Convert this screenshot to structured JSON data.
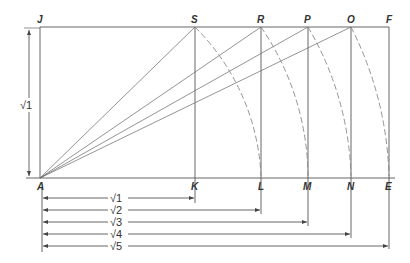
{
  "diagram": {
    "points": {
      "J": {
        "label": "J",
        "x": 40,
        "y": 27
      },
      "S": {
        "label": "S",
        "x": 195,
        "y": 27
      },
      "R": {
        "label": "R",
        "x": 261,
        "y": 27
      },
      "P": {
        "label": "P",
        "x": 308,
        "y": 27
      },
      "O": {
        "label": "O",
        "x": 351,
        "y": 27
      },
      "F": {
        "label": "F",
        "x": 389,
        "y": 27
      },
      "A": {
        "label": "A",
        "x": 40,
        "y": 178
      },
      "K": {
        "label": "K",
        "x": 195,
        "y": 178
      },
      "L": {
        "label": "L",
        "x": 261,
        "y": 178
      },
      "M": {
        "label": "M",
        "x": 308,
        "y": 178
      },
      "N": {
        "label": "N",
        "x": 351,
        "y": 178
      },
      "E": {
        "label": "E",
        "x": 389,
        "y": 178
      }
    },
    "side_dimension": {
      "label": "√1"
    },
    "dimensions": [
      {
        "label": "√1",
        "to": "K"
      },
      {
        "label": "√2",
        "to": "L"
      },
      {
        "label": "√3",
        "to": "M"
      },
      {
        "label": "√4",
        "to": "N"
      },
      {
        "label": "√5",
        "to": "E"
      }
    ],
    "colors": {
      "line": "#555555",
      "arc": "#888888",
      "text": "#333333"
    }
  }
}
